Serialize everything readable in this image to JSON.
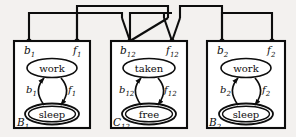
{
  "figure": {
    "kind": "automata-composition-diagram",
    "line_color": "#0d0d0d",
    "fill_color": "#ffffff",
    "background_color": "#f3f1ef",
    "label_style": "italic-serif"
  },
  "components": [
    {
      "id": "B1",
      "name": "B_1",
      "box_label": "B",
      "box_label_sub": "1",
      "ports": [
        {
          "id": "b1-port",
          "label": "b",
          "sub": "1",
          "side": "left"
        },
        {
          "id": "f1-port",
          "label": "f",
          "sub": "1",
          "side": "right"
        }
      ],
      "states": [
        {
          "id": "work1",
          "label": "work",
          "accepting": false
        },
        {
          "id": "sleep1",
          "label": "sleep",
          "accepting": true
        }
      ],
      "transitions": [
        {
          "id": "b1-trans",
          "from": "sleep1",
          "to": "work1",
          "label": "b",
          "sub": "1",
          "side": "left"
        },
        {
          "id": "f1-trans",
          "from": "work1",
          "to": "sleep1",
          "label": "f",
          "sub": "1",
          "side": "right"
        }
      ]
    },
    {
      "id": "C12",
      "name": "C_12",
      "box_label": "C",
      "box_label_sub": "12",
      "ports": [
        {
          "id": "b12-port",
          "label": "b",
          "sub": "12",
          "side": "left"
        },
        {
          "id": "f12-port",
          "label": "f",
          "sub": "12",
          "side": "right"
        }
      ],
      "states": [
        {
          "id": "taken",
          "label": "taken",
          "accepting": false
        },
        {
          "id": "free",
          "label": "free",
          "accepting": true
        }
      ],
      "transitions": [
        {
          "id": "b12-trans",
          "from": "free",
          "to": "taken",
          "label": "b",
          "sub": "12",
          "side": "left"
        },
        {
          "id": "f12-trans",
          "from": "taken",
          "to": "free",
          "label": "f",
          "sub": "12",
          "side": "right"
        }
      ]
    },
    {
      "id": "B2",
      "name": "B_2",
      "box_label": "B",
      "box_label_sub": "2",
      "ports": [
        {
          "id": "b2-port",
          "label": "b",
          "sub": "2",
          "side": "left"
        },
        {
          "id": "f2-port",
          "label": "f",
          "sub": "2",
          "side": "right"
        }
      ],
      "states": [
        {
          "id": "work2",
          "label": "work",
          "accepting": false
        },
        {
          "id": "sleep2",
          "label": "sleep",
          "accepting": true
        }
      ],
      "transitions": [
        {
          "id": "b2-trans",
          "from": "sleep2",
          "to": "work2",
          "label": "b",
          "sub": "2",
          "side": "left"
        },
        {
          "id": "f2-trans",
          "from": "work2",
          "to": "sleep2",
          "label": "f",
          "sub": "2",
          "side": "right"
        }
      ]
    }
  ],
  "connectors": [
    {
      "id": "wire-b1-f1",
      "from": "b1-port",
      "to": "f1-port",
      "description": "bracket joining b1 and f1"
    },
    {
      "id": "wire-f1-b12",
      "from": "f1-port",
      "to": "b12-port",
      "description": "upper wire joining f1 region to b12"
    },
    {
      "id": "wire-b12-f12",
      "from": "b12-port",
      "to": "f12-port",
      "description": "bracket joining b12 and f12"
    },
    {
      "id": "wire-f12-b2",
      "from": "f12-port",
      "to": "b2-port",
      "description": "upper wire joining f12 region to b2"
    },
    {
      "id": "wire-b2-f2",
      "from": "b2-port",
      "to": "f2-port",
      "description": "bracket joining b2 and f2"
    }
  ]
}
